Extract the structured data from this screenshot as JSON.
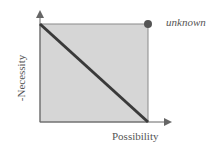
{
  "diagram": {
    "x_axis_label": "Possibility",
    "y_axis_label": "-Necessity",
    "corner_label": "unknown",
    "colors": {
      "square_fill": "#d6d6d6",
      "square_border": "#8a8a8a",
      "diagonal": "#3a3a3a",
      "dot": "#555555",
      "axis": "#666666"
    }
  }
}
